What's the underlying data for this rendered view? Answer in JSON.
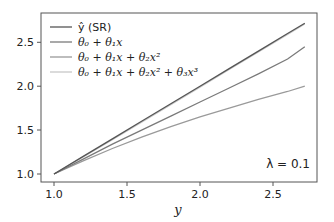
{
  "chart_data": {
    "type": "line",
    "title": "",
    "xlabel": "y",
    "ylabel": "",
    "xlim": [
      0.91,
      2.85
    ],
    "ylim": [
      0.91,
      2.83
    ],
    "xticks": [
      1.0,
      1.5,
      2.0,
      2.5
    ],
    "xtick_labels": [
      "1.0",
      "1.5",
      "2.0",
      "2.5"
    ],
    "yticks": [
      1.0,
      1.5,
      2.0,
      2.5
    ],
    "ytick_labels": [
      "1.0",
      "1.5",
      "2.0",
      "2.5"
    ],
    "grid": false,
    "legend_position": "upper left",
    "annotation": "λ = 0.1",
    "x": [
      1.0,
      1.2,
      1.4,
      1.6,
      1.8,
      2.0,
      2.2,
      2.4,
      2.6,
      2.718
    ],
    "series": [
      {
        "name": "ŷ (SR)",
        "label_parts": [
          "ŷ",
          " (SR)"
        ],
        "color": "#555555",
        "values": [
          1.0,
          1.2,
          1.4,
          1.6,
          1.8,
          2.0,
          2.2,
          2.4,
          2.6,
          2.718
        ]
      },
      {
        "name": "θ0 + θ1x",
        "label_html": "θ<sub>0</sub> + θ<sub>1</sub>x",
        "color": "#7a7a7a",
        "values": [
          1.0,
          1.17,
          1.34,
          1.5,
          1.66,
          1.82,
          1.98,
          2.14,
          2.31,
          2.45
        ]
      },
      {
        "name": "θ0 + θ1x + θ2x²",
        "color": "#9a9a9a",
        "values": [
          1.0,
          1.15,
          1.29,
          1.42,
          1.54,
          1.65,
          1.75,
          1.85,
          1.94,
          2.0
        ]
      },
      {
        "name": "θ0 + θ1x + θ2x² + θ3x³",
        "color": "#c8c8c8",
        "values": [
          1.0,
          1.195,
          1.39,
          1.59,
          1.79,
          1.99,
          2.19,
          2.39,
          2.59,
          2.71
        ]
      }
    ]
  },
  "legend": {
    "items": [
      "ŷ (SR)",
      "θ₀ + θ₁x",
      "θ₀ + θ₁x + θ₂x²",
      "θ₀ + θ₁x + θ₂x² + θ₃x³"
    ]
  },
  "axes": {
    "xlabel": "y",
    "xticks": [
      "1.0",
      "1.5",
      "2.0",
      "2.5"
    ],
    "yticks": [
      "1.0",
      "1.5",
      "2.0",
      "2.5"
    ]
  },
  "annotation": "λ = 0.1"
}
